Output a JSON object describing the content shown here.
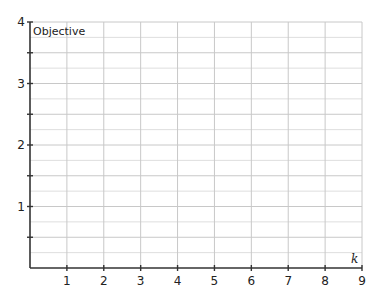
{
  "chart_data": {
    "type": "line",
    "title": "",
    "xlabel": "k",
    "ylabel": "Objective",
    "xlim": [
      0,
      9
    ],
    "ylim": [
      0,
      4
    ],
    "x_ticks": [
      1,
      2,
      3,
      4,
      5,
      6,
      7,
      8,
      9
    ],
    "y_ticks": [
      1,
      2,
      3,
      4
    ],
    "y_minor_ticks": [
      0.5,
      1.5,
      2.5,
      3.5
    ],
    "grid": true,
    "grid_x_step": 1,
    "grid_y_step": 0.25,
    "series": [],
    "legend": null
  },
  "colors": {
    "axis": "#333333",
    "grid_major": "#c8c8c8",
    "grid_minor": "#dedede"
  }
}
